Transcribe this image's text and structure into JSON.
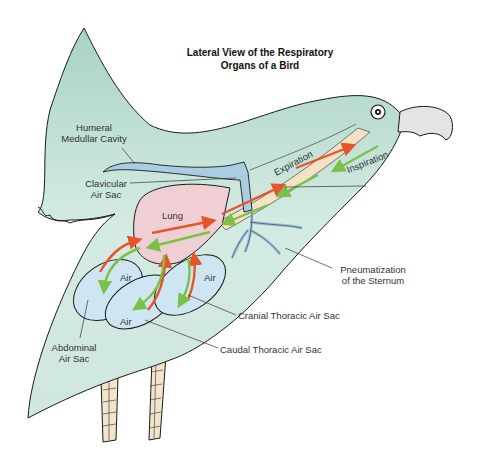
{
  "title": {
    "line1": "Lateral View of the Respiratory",
    "line2": "Organs of a Bird"
  },
  "labels": {
    "humeral_line1": "Humeral",
    "humeral_line2": "Medullar Cavity",
    "clavicular_line1": "Clavicular",
    "clavicular_line2": "Air Sac",
    "lung": "Lung",
    "expiration": "Expiration",
    "inspiration": "Inspiration",
    "air_left": "Air",
    "air_right": "Air",
    "air_bottom": "Air",
    "pneumatization_line1": "Pneumatization",
    "pneumatization_line2": "of the Sternum",
    "cranial": "Cranial Thoracic Air Sac",
    "caudal": "Caudal Thoracic Air Sac",
    "abdominal_line1": "Abdominal",
    "abdominal_line2": "Air Sac"
  },
  "colors": {
    "body": "#cfe7de",
    "body_dark": "#a9d2c5",
    "outline": "#1a1a1a",
    "lung": "#f0cfd4",
    "air_sac": "#cde6f2",
    "cavity": "#aacde3",
    "trachea": "#f3e2c4",
    "beak": "#e4e4e6",
    "expiration_arrow": "#e8542a",
    "inspiration_arrow": "#7cc04a",
    "leg": "#f2e4cf"
  }
}
